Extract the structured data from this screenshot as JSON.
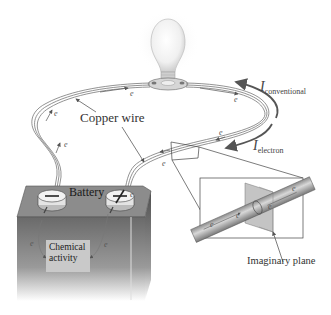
{
  "figure": {
    "labels": {
      "copper_wire": "Copper wire",
      "battery": "Battery",
      "chemical_activity_line1": "Chemical",
      "chemical_activity_line2": "activity",
      "imaginary_plane": "Imaginary plane",
      "i_conventional_symbol": "I",
      "i_conventional_sub": "conventional",
      "i_electron_symbol": "I",
      "i_electron_sub": "electron",
      "electron_symbol": "e"
    },
    "components": [
      "light-bulb",
      "bulb-socket",
      "copper-wire",
      "battery",
      "negative-terminal",
      "positive-terminal",
      "magnified-wire-inset",
      "imaginary-plane"
    ],
    "colors": {
      "background": "#ffffff",
      "wire": "#777777",
      "battery_top": "#8a8a8a",
      "battery_body": "#6e6e6e",
      "inset_plane": "#bdbdbd",
      "arrow": "#555555",
      "text": "#333333"
    }
  }
}
